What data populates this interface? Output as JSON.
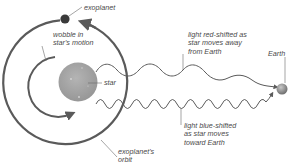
{
  "diagram": {
    "type": "radial-velocity-method",
    "labels": {
      "exoplanet": "exoplanet",
      "wobble": "wobble in\nstar's motion",
      "star": "star",
      "orbit": "exoplanet's\norbit",
      "red_shift": "light red-shifted as\nstar moves away\nfrom Earth",
      "blue_shift": "light blue-shifted\nas star moves\ntoward Earth",
      "earth": "Earth"
    },
    "colors": {
      "line": "#5a5a5a",
      "star_fill": "#a3a3a3",
      "planet_fill": "#3a3a3a",
      "earth_fill": "#8a8a8a",
      "text": "#4a4a4a"
    }
  }
}
